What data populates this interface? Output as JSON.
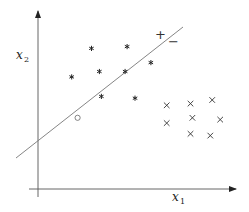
{
  "diagram": {
    "type": "linear-classifier-illustration",
    "axes": {
      "x_label": "x",
      "x_subscript": "1",
      "y_label": "x",
      "y_subscript": "2"
    },
    "separator": {
      "positive_side_label": "+",
      "negative_side_label": "−"
    },
    "classes": [
      {
        "name": "positive",
        "marker": "*",
        "points": [
          [
            0.27,
            0.79
          ],
          [
            0.45,
            0.8
          ],
          [
            0.57,
            0.71
          ],
          [
            0.17,
            0.63
          ],
          [
            0.31,
            0.66
          ],
          [
            0.44,
            0.66
          ],
          [
            0.32,
            0.52
          ],
          [
            0.49,
            0.51
          ]
        ]
      },
      {
        "name": "negative",
        "marker": "×",
        "points": [
          [
            0.65,
            0.47
          ],
          [
            0.77,
            0.48
          ],
          [
            0.88,
            0.5
          ],
          [
            0.65,
            0.37
          ],
          [
            0.78,
            0.4
          ],
          [
            0.92,
            0.39
          ],
          [
            0.77,
            0.31
          ],
          [
            0.87,
            0.3
          ]
        ]
      },
      {
        "name": "query",
        "marker": "○",
        "points": [
          [
            0.2,
            0.4
          ]
        ]
      }
    ]
  }
}
